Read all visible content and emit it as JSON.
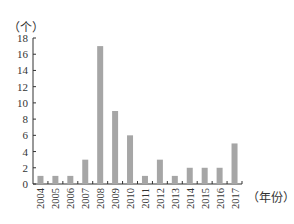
{
  "chart_data": {
    "type": "bar",
    "title": "",
    "xlabel": "（年份）",
    "ylabel": "（个）",
    "categories": [
      "2004",
      "2005",
      "2006",
      "2007",
      "2008",
      "2009",
      "2010",
      "2011",
      "2012",
      "2013",
      "2014",
      "2015",
      "2016",
      "2017"
    ],
    "values": [
      1,
      1,
      1,
      3,
      17,
      9,
      6,
      1,
      3,
      1,
      2,
      2,
      2,
      5
    ],
    "ylim": [
      0,
      18
    ],
    "yticks": [
      0,
      2,
      4,
      6,
      8,
      10,
      12,
      14,
      16,
      18
    ],
    "grid": false,
    "legend": null,
    "bar_color": "#a6a6a6"
  }
}
